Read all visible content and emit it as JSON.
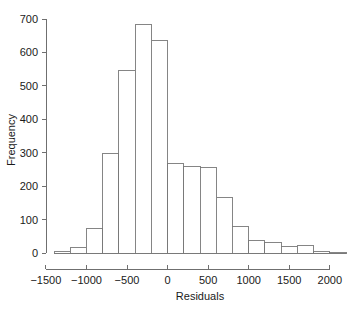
{
  "chart_data": {
    "type": "bar",
    "chart_subtype": "histogram",
    "title": "",
    "subtitle": "",
    "xlabel": "Residuals",
    "ylabel": "Frequency",
    "xlim": [
      -1400,
      2200
    ],
    "ylim": [
      0,
      700
    ],
    "grid": false,
    "legend": null,
    "bin_width": 200,
    "bin_edges": [
      -1400,
      -1200,
      -1000,
      -800,
      -600,
      -400,
      -200,
      0,
      200,
      400,
      600,
      800,
      1000,
      1200,
      1400,
      1600,
      1800,
      2000,
      2200
    ],
    "categories": [
      "-1400..-1200",
      "-1200..-1000",
      "-1000..-800",
      "-800..-600",
      "-600..-400",
      "-400..-200",
      "-200..0",
      "0..200",
      "200..400",
      "400..600",
      "600..800",
      "800..1000",
      "1000..1200",
      "1200..1400",
      "1400..1600",
      "1600..1800",
      "1800..2000",
      "2000..2200"
    ],
    "values": [
      5,
      17,
      74,
      297,
      545,
      685,
      637,
      267,
      260,
      255,
      167,
      79,
      38,
      31,
      19,
      23,
      5,
      1
    ],
    "x_ticks": [
      -1500,
      -1000,
      -500,
      0,
      500,
      1000,
      1500,
      2000
    ],
    "x_tick_labels": [
      "−1500",
      "−1000",
      "−500",
      "0",
      "500",
      "1000",
      "1500",
      "2000"
    ],
    "y_ticks": [
      0,
      100,
      200,
      300,
      400,
      500,
      600,
      700
    ],
    "y_tick_labels": [
      "0",
      "100",
      "200",
      "300",
      "400",
      "500",
      "600",
      "700"
    ],
    "colors": {
      "bar_fill": "#ffffff",
      "bar_stroke": "#787878",
      "axis": "#6f6f6f",
      "text": "#1a1a1a",
      "background": "#ffffff"
    }
  }
}
